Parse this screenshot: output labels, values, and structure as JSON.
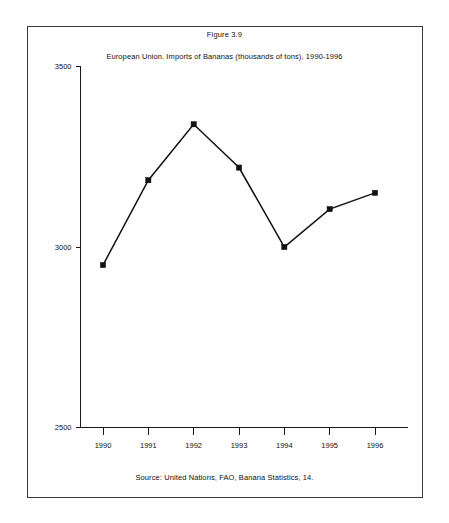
{
  "figure": {
    "number_label": "Figure 3.9",
    "title": "European Union. Imports of Bananas (thousands of tons), 1990-1996",
    "source_note": "Source: United Nations, FAO, Banana Statistics, 14."
  },
  "colors": {
    "line": "#111111",
    "marker": "#111111",
    "axis": "#1a1a1a",
    "border": "#3a3a3a",
    "background": "#ffffff"
  },
  "axes": {
    "y_ticks": [
      "3500",
      "3000",
      "2500"
    ],
    "x_ticks": [
      "1990",
      "1991",
      "1992",
      "1993",
      "1994",
      "1995",
      "1996"
    ]
  },
  "chart_data": {
    "type": "line",
    "title": "European Union. Imports of Bananas (thousands of tons), 1990-1996",
    "subtitle": "Figure 3.9",
    "xlabel": "",
    "ylabel": "",
    "categories": [
      "1990",
      "1991",
      "1992",
      "1993",
      "1994",
      "1995",
      "1996"
    ],
    "values": [
      2950,
      3185,
      3340,
      3220,
      3000,
      3105,
      3150
    ],
    "series": [
      {
        "name": "European Union imports of bananas",
        "values": [
          2950,
          3185,
          3340,
          3220,
          3000,
          3105,
          3150
        ]
      }
    ],
    "ylim": [
      2500,
      3500
    ],
    "yticks": [
      2500,
      3000,
      3500
    ],
    "grid": false,
    "legend": false,
    "marker": "square",
    "units": "thousands of tons",
    "source": "Source: United Nations, FAO, Banana Statistics, 14."
  }
}
